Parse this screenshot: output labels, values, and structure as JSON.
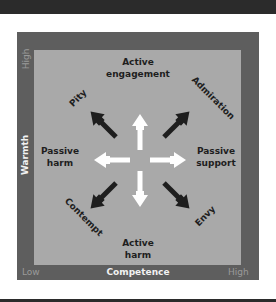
{
  "diagram": {
    "axes": {
      "x_title": "Competence",
      "y_title": "Warmth",
      "x_low": "Low",
      "x_high": "High",
      "y_high": "High"
    },
    "labels": {
      "top": [
        "Active",
        "engagement"
      ],
      "bottom": [
        "Active",
        "harm"
      ],
      "left": [
        "Passive",
        "harm"
      ],
      "right": [
        "Passive",
        "support"
      ],
      "top_left": "Pity",
      "top_right": "Admiration",
      "bottom_left": "Contempt",
      "bottom_right": "Envy"
    },
    "colors": {
      "frame": "#5e5e5e",
      "panel": "#a9a9a9",
      "white_arrow": "#ffffff",
      "dark_arrow": "#1e1e1e"
    }
  }
}
